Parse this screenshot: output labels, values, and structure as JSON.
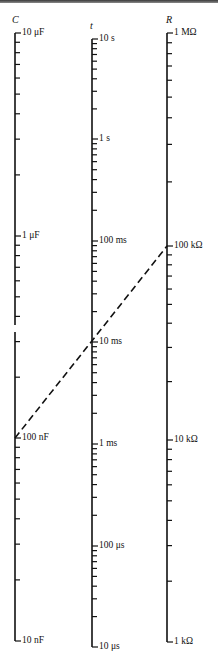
{
  "figure": {
    "type": "nomogram",
    "axes": [
      {
        "id": "C",
        "title": "C",
        "x": 15,
        "decade_labels": [
          "10 μF",
          "1 μF",
          "100 nF",
          "10 nF"
        ],
        "decade_y": [
          33,
          236,
          438,
          641
        ]
      },
      {
        "id": "t",
        "title": "t",
        "x": 92,
        "decade_labels": [
          "10 s",
          "1 s",
          "100 ms",
          "10 ms",
          "1 ms",
          "100 μs",
          "10 μs"
        ],
        "decade_y": [
          39,
          139,
          241,
          342,
          444,
          546,
          647
        ]
      },
      {
        "id": "R",
        "title": "R",
        "x": 167,
        "decade_labels": [
          "1 MΩ",
          "100 kΩ",
          "10 kΩ",
          "1 kΩ"
        ],
        "decade_y": [
          33,
          246,
          440,
          642
        ]
      }
    ],
    "example_line": {
      "style": "dashed",
      "from": {
        "axis": "C",
        "value": "100 nF"
      },
      "through": {
        "axis": "t",
        "value": "10 ms"
      },
      "to": {
        "axis": "R",
        "value": "100 kΩ"
      }
    },
    "colors": {
      "ink": "#111111",
      "background": "#ffffff",
      "top_band": "#555555"
    }
  }
}
